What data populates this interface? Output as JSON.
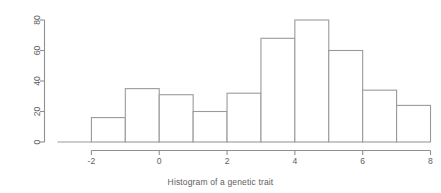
{
  "caption": "Histogram of a genetic trait",
  "colors": {
    "background": "#ffffff",
    "axis": "#8f8f8f",
    "bar_stroke": "#9a9a9a",
    "bar_fill": "#ffffff",
    "text": "#5e5e5e"
  },
  "axes": {
    "x": {
      "ticks": [
        "-2",
        "0",
        "2",
        "4",
        "6",
        "8"
      ],
      "tick_values": [
        -2,
        0,
        2,
        4,
        6,
        8
      ],
      "range": [
        -3,
        8
      ],
      "label": ""
    },
    "y": {
      "ticks": [
        "0",
        "20",
        "40",
        "60",
        "80"
      ],
      "tick_values": [
        0,
        20,
        40,
        60,
        80
      ],
      "range": [
        0,
        80
      ],
      "label": "",
      "label_rotation": "90"
    }
  },
  "chart_data": {
    "type": "bar",
    "title": "Histogram of a genetic trait",
    "xlabel": "",
    "ylabel": "",
    "xlim": [
      -3,
      8
    ],
    "ylim": [
      0,
      80
    ],
    "grid": false,
    "legend": false,
    "bin_edges": [
      -3,
      -2,
      -1,
      0,
      1,
      2,
      3,
      4,
      5,
      6,
      7,
      8
    ],
    "categories": [
      "-3 to -2",
      "-2 to -1",
      "-1 to 0",
      "0 to 1",
      "1 to 2",
      "2 to 3",
      "3 to 4",
      "4 to 5",
      "5 to 6",
      "6 to 7",
      "7 to 8"
    ],
    "values": [
      0,
      16,
      35,
      31,
      20,
      32,
      68,
      80,
      60,
      34,
      24
    ]
  }
}
